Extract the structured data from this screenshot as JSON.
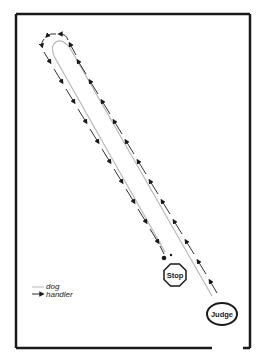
{
  "diagram": {
    "type": "rally-obedience-course",
    "ring": {
      "left": 16,
      "top": 14,
      "right": 250,
      "bottom": 348,
      "entrance_gap": [
        212,
        243
      ],
      "stroke": "#1a1a1a"
    },
    "stations": {
      "stop": {
        "label": "Stop",
        "shape": "octagon",
        "cx": 175,
        "cy": 275
      },
      "judge": {
        "label": "Judge",
        "shape": "ellipse",
        "cx": 222,
        "cy": 314
      }
    },
    "legend": {
      "dog_label": "dog",
      "handler_label": "handler"
    },
    "colors": {
      "dog_path": "#b8b8b8",
      "handler_path": "#1a1a1a",
      "background": "#ffffff"
    }
  }
}
